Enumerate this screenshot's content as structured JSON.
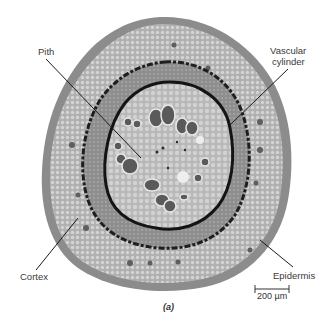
{
  "figure": {
    "caption": "(a)",
    "labels": {
      "pith": "Pith",
      "vascular_line1": "Vascular",
      "vascular_line2": "cylinder",
      "cortex": "Cortex",
      "epidermis": "Epidermis"
    },
    "scale_bar": {
      "text": "200 µm"
    },
    "colors": {
      "epidermis_outer": "#8c8c8c",
      "cortex": "#b4b4b4",
      "cortex_cells": "#d6d6d6",
      "vascular_ring": "#1e1e1e",
      "vascular_tissue": "#8a8a8a",
      "pith": "#c4c4c4",
      "vessel": "#5a5a5a",
      "leader_line": "#1a1a1a"
    }
  }
}
